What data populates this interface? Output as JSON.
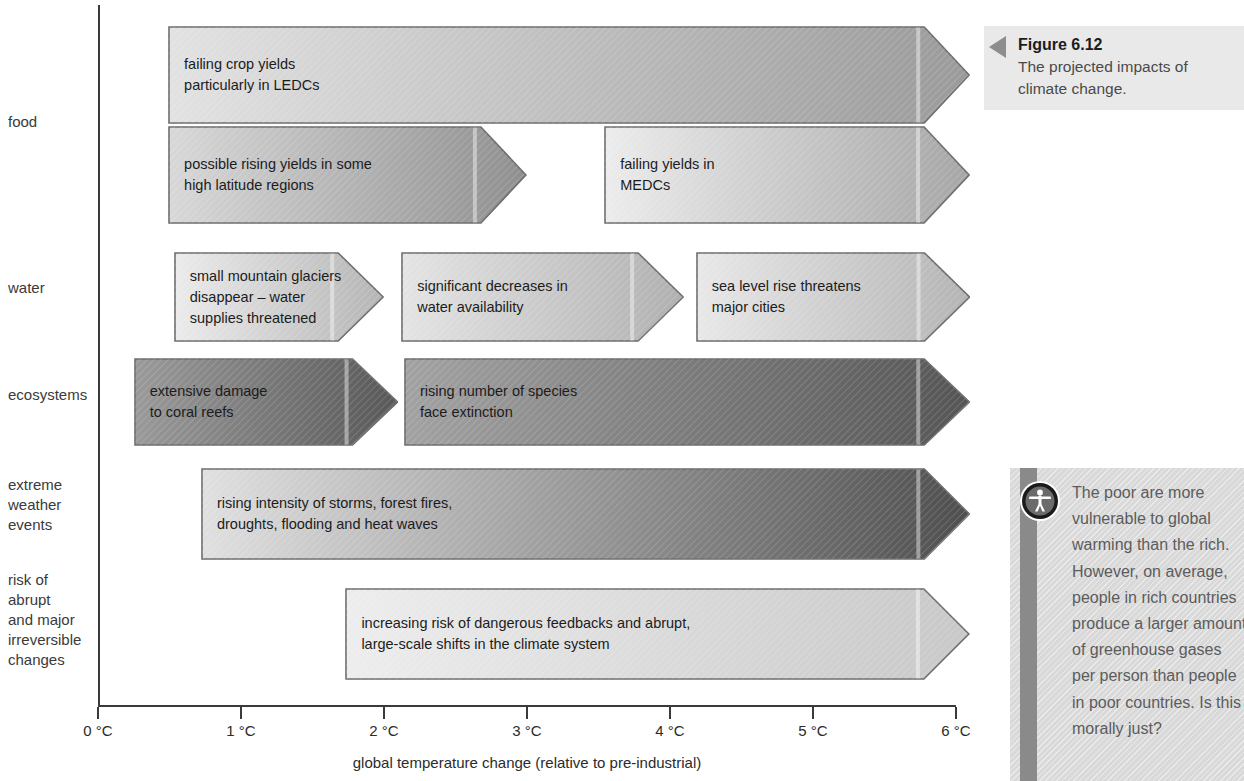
{
  "chart_data": {
    "type": "bar",
    "title": "The projected impacts of climate change.",
    "xlabel": "global temperature change (relative to pre-industrial)",
    "ylabel": "",
    "xlim": [
      0,
      6
    ],
    "x_unit": "°C",
    "xticks": [
      "0 °C",
      "1 °C",
      "2 °C",
      "3 °C",
      "4 °C",
      "5 °C",
      "6 °C"
    ],
    "xtick_values": [
      0,
      1,
      2,
      3,
      4,
      5,
      6
    ],
    "grid": false,
    "legend": "none",
    "categories": [
      "food",
      "water",
      "ecosystems",
      "extreme weather events",
      "risk of abrupt and major irreversible changes"
    ],
    "bars": [
      {
        "category": "food",
        "label": "failing crop yields\nparticularly in LEDCs",
        "start": 0.49,
        "end": 6.1,
        "shade_start": "#e2e2e2",
        "shade_end": "#9a9a9a"
      },
      {
        "category": "food",
        "label": "possible rising yields in some\nhigh latitude regions",
        "start": 0.49,
        "end": 3.0,
        "shade_start": "#d8d8d8",
        "shade_end": "#8f8f8f"
      },
      {
        "category": "food",
        "label": "failing yields in\nMEDCs",
        "start": 3.54,
        "end": 6.1,
        "shade_start": "#ececec",
        "shade_end": "#a6a6a6"
      },
      {
        "category": "water",
        "label": "small mountain glaciers\ndisappear – water\nsupplies threatened",
        "start": 0.53,
        "end": 2.0,
        "shade_start": "#ebebeb",
        "shade_end": "#b5b5b5"
      },
      {
        "category": "water",
        "label": "significant decreases in\nwater availability",
        "start": 2.12,
        "end": 4.1,
        "shade_start": "#e4e4e4",
        "shade_end": "#b0b0b0"
      },
      {
        "category": "water",
        "label": "sea level rise threatens\nmajor cities",
        "start": 4.18,
        "end": 6.1,
        "shade_start": "#e8e8e8",
        "shade_end": "#b4b4b4"
      },
      {
        "category": "ecosystems",
        "label": "extensive damage\nto coral reefs",
        "start": 0.25,
        "end": 2.1,
        "shade_start": "#9a9a9a",
        "shade_end": "#585858"
      },
      {
        "category": "ecosystems",
        "label": "rising number of species\nface extinction",
        "start": 2.14,
        "end": 6.1,
        "shade_start": "#a2a2a2",
        "shade_end": "#555555"
      },
      {
        "category": "extreme weather events",
        "label": "rising intensity of storms, forest fires,\ndroughts, flooding and heat waves",
        "start": 0.72,
        "end": 6.1,
        "shade_start": "#e0e0e0",
        "shade_end": "#4e4e4e"
      },
      {
        "category": "risk of abrupt and major irreversible changes",
        "label": "increasing risk of dangerous feedbacks and abrupt,\nlarge-scale shifts in the climate system",
        "start": 1.73,
        "end": 6.1,
        "shade_start": "#ededed",
        "shade_end": "#c8c8c8"
      }
    ]
  },
  "axis": {
    "ticks": [
      {
        "label": "0 °C",
        "value": 0
      },
      {
        "label": "1 °C",
        "value": 1
      },
      {
        "label": "2 °C",
        "value": 2
      },
      {
        "label": "3 °C",
        "value": 3
      },
      {
        "label": "4 °C",
        "value": 4
      },
      {
        "label": "5 °C",
        "value": 5
      },
      {
        "label": "6 °C",
        "value": 6
      }
    ],
    "title": "global temperature change (relative to pre-industrial)"
  },
  "rows": [
    {
      "id": "food",
      "label": "food",
      "top": 112
    },
    {
      "id": "water",
      "label": "water",
      "top": 278
    },
    {
      "id": "ecosystems",
      "label": "ecosystems",
      "top": 385
    },
    {
      "id": "extreme",
      "label": "extreme\nweather\nevents",
      "top": 475
    },
    {
      "id": "risk",
      "label": "risk of\nabrupt\nand major\nirreversible\nchanges",
      "top": 570
    }
  ],
  "figure": {
    "number": "Figure 6.12",
    "caption": "The projected impacts of\nclimate change."
  },
  "thinkbox": {
    "icon": "person-in-circle-icon",
    "text": "The poor are more\nvulnerable to global\nwarming than the rich.\nHowever, on average,\npeople in rich countries\nproduce a larger amount\nof greenhouse gases\nper person than people\nin poor countries. Is this\nmorally just?"
  },
  "colors": {
    "axis": "#3a3a3a",
    "text": "#2b2b2b",
    "caption_bg": "#e9e9e9",
    "thinkbox_bg": "#d9d9d9",
    "thinkbox_spine": "#8a8a8a",
    "arrow_stroke": "#6e6e6e"
  }
}
